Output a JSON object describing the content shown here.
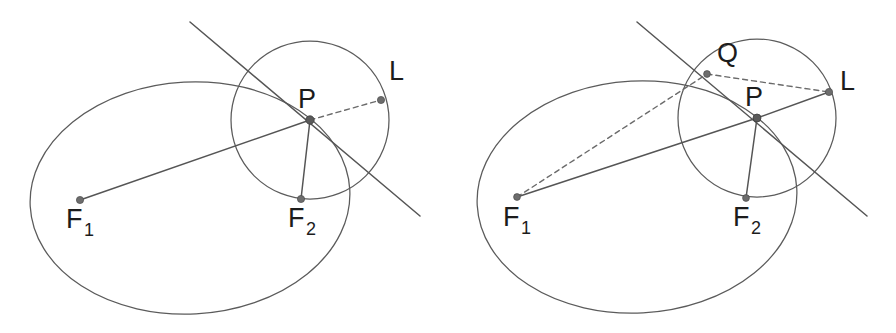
{
  "figure": {
    "background_color": "#ffffff",
    "stroke_color": "#5b5b5b",
    "label_color": "#1c1c1c",
    "width": 896,
    "height": 333,
    "caption": ""
  },
  "panels": [
    {
      "id": "left",
      "name": "ellipse-tangent-panel-left",
      "labels": {
        "f1": "F",
        "f1_sub": "1",
        "f2": "F",
        "f2_sub": "2",
        "p": "P",
        "l": "L"
      },
      "points": {
        "f1": {
          "x": 80,
          "y": 200,
          "label": "F1"
        },
        "f2": {
          "x": 301,
          "y": 199,
          "label": "F2"
        },
        "p": {
          "x": 310,
          "y": 120,
          "label": "P"
        },
        "l": {
          "x": 381,
          "y": 100,
          "label": "L"
        }
      },
      "label_positions": {
        "f1": {
          "x": 66,
          "y": 228
        },
        "f1_sub": {
          "x": 84,
          "y": 236
        },
        "f2": {
          "x": 288,
          "y": 227
        },
        "f2_sub": {
          "x": 306,
          "y": 235
        },
        "p": {
          "x": 298,
          "y": 108
        },
        "l": {
          "x": 389,
          "y": 80
        }
      },
      "ellipse": {
        "cx": 190,
        "cy": 198,
        "rx": 160,
        "ry": 116,
        "rotation": -3
      },
      "circle": {
        "cx": 310,
        "cy": 120,
        "r": 79
      },
      "segments": [
        {
          "name": "f1-to-p",
          "from": "f1",
          "to": "p",
          "style": "solid"
        },
        {
          "name": "p-to-f2",
          "from": "p",
          "to": "f2",
          "style": "solid"
        },
        {
          "name": "p-to-l",
          "from": "p",
          "to": "l",
          "style": "dashed"
        }
      ],
      "tangent_line": {
        "x1": 190,
        "y1": 22,
        "x2": 420,
        "y2": 216
      }
    },
    {
      "id": "right",
      "name": "ellipse-tangent-panel-right",
      "labels": {
        "f1": "F",
        "f1_sub": "1",
        "f2": "F",
        "f2_sub": "2",
        "p": "P",
        "q": "Q",
        "l": "L"
      },
      "points": {
        "f1": {
          "x": 517,
          "y": 197,
          "label": "F1"
        },
        "f2": {
          "x": 746,
          "y": 198,
          "label": "F2"
        },
        "p": {
          "x": 757,
          "y": 118,
          "label": "P"
        },
        "q": {
          "x": 707,
          "y": 74,
          "label": "Q"
        },
        "l": {
          "x": 829,
          "y": 92,
          "label": "L"
        }
      },
      "label_positions": {
        "f1": {
          "x": 503,
          "y": 226
        },
        "f1_sub": {
          "x": 521,
          "y": 234
        },
        "f2": {
          "x": 733,
          "y": 226
        },
        "f2_sub": {
          "x": 751,
          "y": 234
        },
        "p": {
          "x": 745,
          "y": 106
        },
        "q": {
          "x": 717,
          "y": 62
        },
        "l": {
          "x": 840,
          "y": 90
        }
      },
      "ellipse": {
        "cx": 637,
        "cy": 197,
        "rx": 160,
        "ry": 116,
        "rotation": -3
      },
      "circle": {
        "cx": 757,
        "cy": 118,
        "r": 79
      },
      "segments": [
        {
          "name": "f1-to-p",
          "from": "f1",
          "to": "p",
          "style": "solid"
        },
        {
          "name": "p-to-l",
          "from": "p",
          "to": "l",
          "style": "solid"
        },
        {
          "name": "p-to-f2",
          "from": "p",
          "to": "f2",
          "style": "solid"
        },
        {
          "name": "f1-to-q",
          "from": "f1",
          "to": "q",
          "style": "dashed"
        },
        {
          "name": "q-to-l",
          "from": "q",
          "to": "l",
          "style": "dashed"
        }
      ],
      "tangent_line": {
        "x1": 637,
        "y1": 22,
        "x2": 867,
        "y2": 216
      }
    }
  ]
}
